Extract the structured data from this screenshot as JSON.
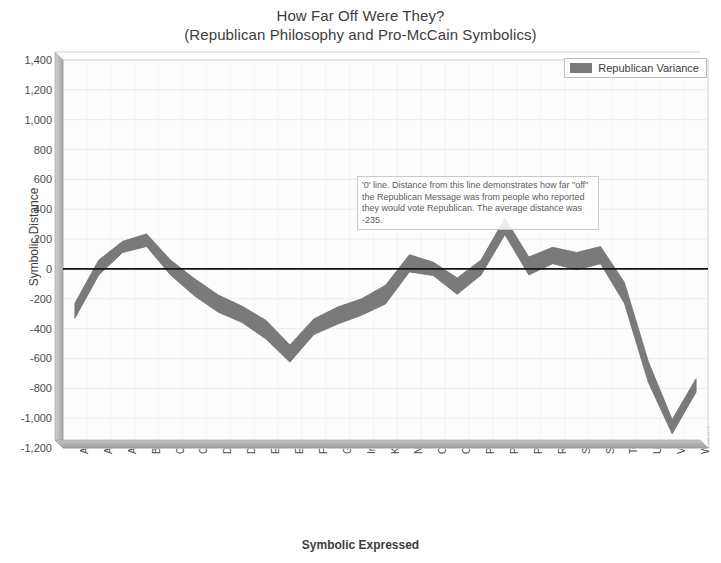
{
  "chart_data": {
    "type": "area",
    "title": "How Far Off Were They?",
    "subtitle": "(Republican Philosophy and Pro-McCain Symbolics)",
    "xlabel": "Symbolic Expressed",
    "ylabel": "Symbolic Distance",
    "ylim": [
      -1200,
      1400
    ],
    "ytick_step": 200,
    "yticks": [
      "1,400",
      "1,200",
      "1,000",
      "800",
      "600",
      "400",
      "200",
      "0",
      "-200",
      "-400",
      "-600",
      "-800",
      "-1,000",
      "-1,200"
    ],
    "grid": true,
    "legend_position": "top-right",
    "legend": [
      "Republican Variance"
    ],
    "series_fill_color": "#7a7a7a",
    "zero_line_color": "#1b1b1b",
    "average_distance": -235,
    "categories": [
      "Absent",
      "Analog",
      "Atemporal",
      "Backward",
      "Comparative",
      "Creative",
      "Digital",
      "Distemporal",
      "Emotional",
      "External",
      "Forward",
      "Gustatory",
      "Intemporal",
      "Kenesthetic",
      "Nearness",
      "Olfactory",
      "Otherness",
      "Past",
      "Pieces",
      "Process",
      "Relative",
      "Sensory",
      "Spiritual",
      "Temporal",
      "Upward",
      "VomeroNasal",
      "Within"
    ],
    "series": [
      {
        "name": "Republican Variance High",
        "values": [
          -230,
          60,
          185,
          235,
          60,
          -65,
          -175,
          -250,
          -345,
          -510,
          -335,
          -255,
          -200,
          -110,
          95,
          45,
          -60,
          60,
          340,
          80,
          145,
          110,
          150,
          -90,
          -620,
          -1010,
          -735
        ]
      },
      {
        "name": "Republican Variance Low",
        "values": [
          -330,
          -40,
          110,
          150,
          -40,
          -180,
          -290,
          -360,
          -470,
          -625,
          -440,
          -370,
          -310,
          -235,
          -20,
          -45,
          -170,
          -40,
          230,
          -40,
          35,
          -5,
          35,
          -230,
          -760,
          -1105,
          -825
        ]
      }
    ],
    "annotations": [
      {
        "name": "zero-line-note",
        "text": "'0' line. Distance from this line demonstrates how far \"off\" the Republican Message was from people who reported they would vote Republican. The average distance was -235."
      }
    ]
  },
  "legend": {
    "label": "Republican Variance"
  },
  "note": {
    "text": "'0' line. Distance from this line demonstrates how far \"off\" the Republican Message was from people who reported they would vote Republican. The average distance was -235."
  }
}
